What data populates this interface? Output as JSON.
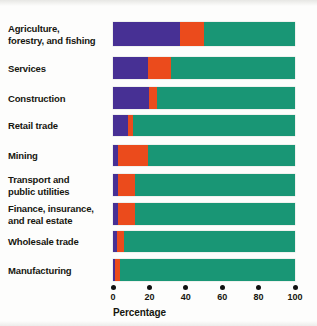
{
  "chart_data": {
    "type": "bar",
    "subtype": "stacked-horizontal-100-percent",
    "title": "",
    "xlabel": "Percentage",
    "ylabel": "",
    "xlim": [
      0,
      100
    ],
    "xticks": [
      0,
      20,
      40,
      60,
      80,
      100
    ],
    "xtick_labels": [
      "0",
      "20",
      "40",
      "60",
      "80",
      "100"
    ],
    "grid": false,
    "legend": "none",
    "orientation": "horizontal",
    "categories": [
      "Agriculture, forestry, and fishing",
      "Services",
      "Construction",
      "Retail trade",
      "Mining",
      "Transport and public utilities",
      "Finance, insurance, and real estate",
      "Wholesale trade",
      "Manufacturing"
    ],
    "series": [
      {
        "name": "segment-1",
        "color": "#473094",
        "values": [
          37,
          19,
          20,
          8,
          3,
          3,
          3,
          2,
          1
        ]
      },
      {
        "name": "segment-2",
        "color": "#eb4b1c",
        "values": [
          13,
          13,
          4,
          3,
          16,
          9,
          9,
          4,
          3
        ]
      },
      {
        "name": "segment-3",
        "color": "#199675",
        "values": [
          50,
          68,
          76,
          89,
          81,
          88,
          88,
          94,
          96
        ]
      }
    ]
  },
  "axis": {
    "title": "Percentage",
    "ticks": [
      {
        "label": "0",
        "value": 0
      },
      {
        "label": "20",
        "value": 20
      },
      {
        "label": "40",
        "value": 40
      },
      {
        "label": "60",
        "value": 60
      },
      {
        "label": "80",
        "value": 80
      },
      {
        "label": "100",
        "value": 100
      }
    ]
  },
  "rows": [
    {
      "label": "Agriculture,\nforestry, and fishing",
      "label_lines": [
        "Agriculture,",
        "forestry, and fishing"
      ],
      "values": [
        37,
        13,
        50
      ]
    },
    {
      "label": "Services",
      "label_lines": [
        "Services"
      ],
      "values": [
        19,
        13,
        68
      ]
    },
    {
      "label": "Construction",
      "label_lines": [
        "Construction"
      ],
      "values": [
        20,
        4,
        76
      ]
    },
    {
      "label": "Retail trade",
      "label_lines": [
        "Retail trade"
      ],
      "values": [
        8,
        3,
        89
      ]
    },
    {
      "label": "Mining",
      "label_lines": [
        "Mining"
      ],
      "values": [
        3,
        16,
        81
      ]
    },
    {
      "label": "Transport and\npublic utilities",
      "label_lines": [
        "Transport and",
        "public utilities"
      ],
      "values": [
        3,
        9,
        88
      ]
    },
    {
      "label": "Finance, insurance,\nand real estate",
      "label_lines": [
        "Finance, insurance,",
        "and real estate"
      ],
      "values": [
        3,
        9,
        88
      ]
    },
    {
      "label": "Wholesale trade",
      "label_lines": [
        "Wholesale trade"
      ],
      "values": [
        2,
        4,
        94
      ]
    },
    {
      "label": "Manufacturing",
      "label_lines": [
        "Manufacturing"
      ],
      "values": [
        1,
        3,
        96
      ]
    }
  ],
  "colors": {
    "segment_1": "#473094",
    "segment_2": "#eb4b1c",
    "segment_3": "#199675",
    "text": "#16160f",
    "background": "#fdfdfc"
  },
  "layout": {
    "plot_left_px": 113,
    "plot_width_px": 182,
    "row_tops_px": [
      22,
      57,
      87,
      115,
      145,
      174,
      203,
      231,
      259
    ],
    "row_heights_px": [
      24,
      22,
      22,
      21,
      21,
      22,
      22,
      21,
      22
    ]
  }
}
